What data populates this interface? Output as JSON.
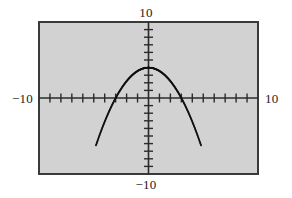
{
  "figure": {
    "name": "graphing-calculator-viewport",
    "background_color": "#d2d2d2",
    "frame_color": "#3a3a3a",
    "axis_color": "#2b2b2b",
    "curve_color": "#111111",
    "labels": {
      "top": "10",
      "bottom": "−10",
      "left": "−10",
      "right": "10"
    }
  },
  "chart_data": {
    "type": "line",
    "title": "",
    "xlabel": "",
    "ylabel": "",
    "xlim": [
      -10,
      10
    ],
    "ylim": [
      -10,
      10
    ],
    "grid": false,
    "legend": null,
    "xticks": [
      -9,
      -8,
      -7,
      -6,
      -5,
      -4,
      -3,
      -2,
      -1,
      1,
      2,
      3,
      4,
      5,
      6,
      7,
      8,
      9
    ],
    "yticks": [
      -9,
      -8,
      -7,
      -6,
      -5,
      -4,
      -3,
      -2,
      -1,
      1,
      2,
      3,
      4,
      5,
      6,
      7,
      8,
      9
    ],
    "xtick_labels": [
      "−10",
      "10"
    ],
    "ytick_labels": [
      "10",
      "−10"
    ],
    "series": [
      {
        "name": "parabola",
        "style": "dotted",
        "equation": "y = 4 - x^2 * 4/9",
        "vertex": [
          0,
          4
        ],
        "roots": [
          -3,
          3
        ],
        "x": [
          -4.8,
          -4.5,
          -4.2,
          -3.9,
          -3.6,
          -3.3,
          -3.0,
          -2.7,
          -2.4,
          -2.1,
          -1.8,
          -1.5,
          -1.2,
          -0.9,
          -0.6,
          -0.3,
          0.0,
          0.3,
          0.6,
          0.9,
          1.2,
          1.5,
          1.8,
          2.1,
          2.4,
          2.7,
          3.0,
          3.3,
          3.6,
          3.9,
          4.2,
          4.5,
          4.8
        ],
        "y": [
          -6.24,
          -5.0,
          -3.84,
          -2.76,
          -1.76,
          -0.84,
          0.0,
          0.76,
          1.44,
          2.04,
          2.56,
          3.0,
          3.36,
          3.64,
          3.84,
          3.96,
          4.0,
          3.96,
          3.84,
          3.64,
          3.36,
          3.0,
          2.56,
          2.04,
          1.44,
          0.76,
          0.0,
          -0.84,
          -1.76,
          -2.76,
          -3.84,
          -5.0,
          -6.24
        ]
      }
    ]
  }
}
